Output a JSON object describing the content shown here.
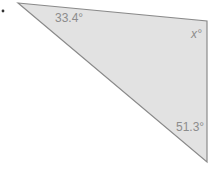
{
  "diagram": {
    "type": "triangle",
    "fill": "#e2e2e2",
    "stroke": "#8a8a8a",
    "label_color": "#8c8c8c",
    "vertices": {
      "top_left": [
        18,
        3
      ],
      "top_right": [
        207,
        21
      ],
      "bottom": [
        207,
        162
      ]
    },
    "angles": {
      "top_left": "33.4°",
      "top_right": "x°",
      "bottom": "51.3°"
    },
    "bullet": "•"
  }
}
